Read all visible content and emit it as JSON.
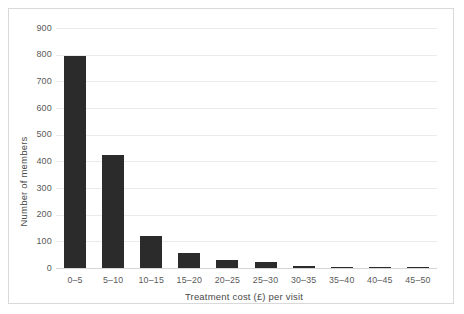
{
  "chart_data": {
    "type": "bar",
    "title": "",
    "xlabel": "Treatment cost (£) per visit",
    "ylabel": "Number of members",
    "categories": [
      "0–5",
      "5–10",
      "10–15",
      "15–20",
      "20–25",
      "25–30",
      "30–35",
      "35–40",
      "40–45",
      "45–50"
    ],
    "values": [
      795,
      425,
      120,
      55,
      30,
      22,
      8,
      5,
      3,
      2
    ],
    "ylim": [
      0,
      900
    ],
    "yticks": [
      0,
      100,
      200,
      300,
      400,
      500,
      600,
      700,
      800,
      900
    ],
    "ytick_labels": [
      "0",
      "100",
      "200",
      "300",
      "400",
      "500",
      "600",
      "700",
      "800",
      "900"
    ],
    "grid": true,
    "legend": "none",
    "bar_color": "#2b2b2b",
    "grid_color": "#ebebeb",
    "axis_color": "#d5d5d5",
    "background": "#ffffff"
  }
}
